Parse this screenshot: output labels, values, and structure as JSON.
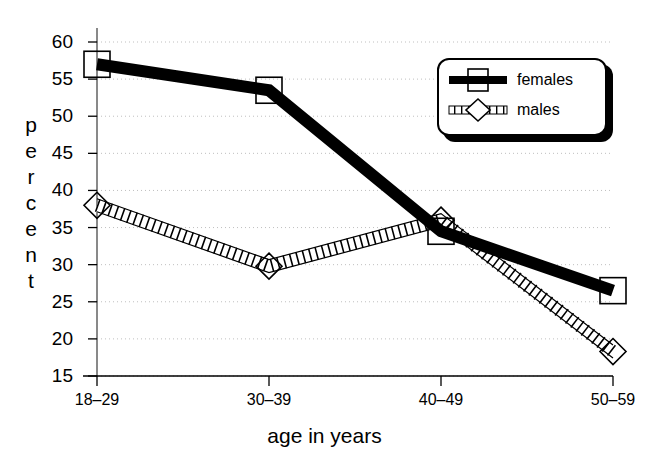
{
  "chart_data": {
    "type": "line",
    "title": "",
    "xlabel": "age in years",
    "ylabel": "percent",
    "categories": [
      "18–29",
      "30–39",
      "40–49",
      "50–59"
    ],
    "ylim": [
      15,
      60
    ],
    "yticks": [
      15,
      20,
      25,
      30,
      35,
      40,
      45,
      50,
      55,
      60
    ],
    "grid": true,
    "legend_position": "top-right",
    "series": [
      {
        "name": "females",
        "values": [
          57,
          53.5,
          34.5,
          26.5
        ],
        "color": "#000000",
        "marker": "square",
        "line_style": "thick-solid"
      },
      {
        "name": "males",
        "values": [
          38,
          29.8,
          36,
          18.3
        ],
        "color": "#000000",
        "marker": "diamond",
        "line_style": "hatched"
      }
    ]
  },
  "axes": {
    "y_title_letters": [
      "p",
      "e",
      "r",
      "c",
      "e",
      "n",
      "t"
    ],
    "y_tick_labels": [
      "60",
      "55",
      "50",
      "45",
      "40",
      "35",
      "30",
      "25",
      "20",
      "15"
    ],
    "x_tick_labels": [
      "18–29",
      "30–39",
      "40–49",
      "50–59"
    ],
    "x_title": "age in years"
  },
  "legend": {
    "items": [
      {
        "label": "females",
        "key": "thick-black-line-with-square-marker"
      },
      {
        "label": "males",
        "key": "hatched-line-with-diamond-marker"
      }
    ]
  },
  "colors": {
    "ink": "#000000",
    "grid": "#bfbfbf",
    "background": "#ffffff"
  }
}
